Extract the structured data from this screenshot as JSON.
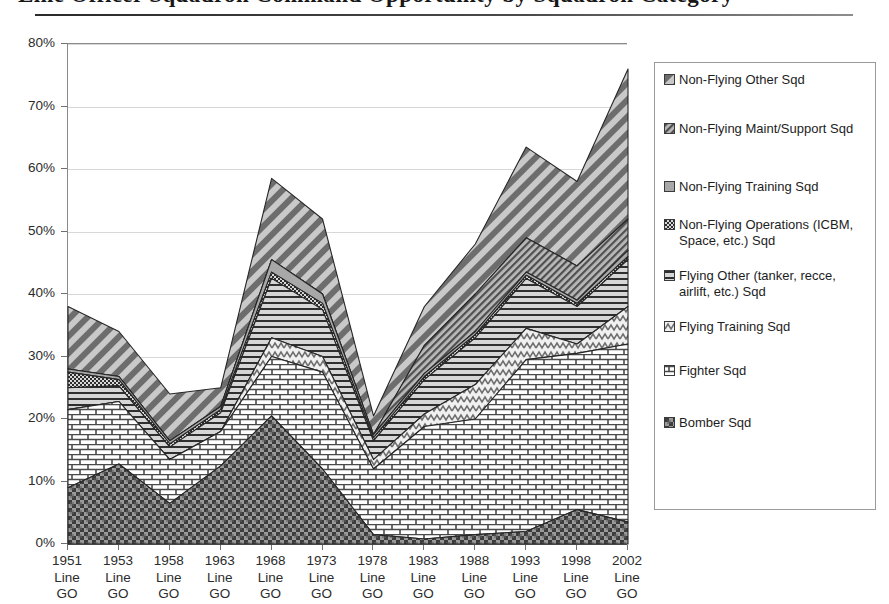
{
  "document": {
    "title_fragment": "Line Officer Squadron Command Opportunity by Squadron Category",
    "rule": "horizontal-rule"
  },
  "chart": {
    "y_axis": {
      "ticks": [
        "0%",
        "10%",
        "20%",
        "30%",
        "40%",
        "50%",
        "60%",
        "70%",
        "80%"
      ],
      "min": 0,
      "max": 80,
      "step": 10
    },
    "x_axis": {
      "line_label": "Line",
      "go_label": "GO"
    },
    "legend": {
      "items": [
        {
          "label": "Non-Flying Other Sqd",
          "pattern": "diagonal-stripe-dark"
        },
        {
          "label": "Non-Flying Maint/Support Sqd",
          "pattern": "diagonal-stripe-gray"
        },
        {
          "label": "Non-Flying Training Sqd",
          "pattern": "solid-gray"
        },
        {
          "label": "Non-Flying Operations (ICBM, Space, etc.) Sqd",
          "pattern": "checker-dot"
        },
        {
          "label": "Flying Other (tanker, recce, airlift, etc.) Sqd",
          "pattern": "horizontal-line"
        },
        {
          "label": "Flying Training Sqd",
          "pattern": "zigzag-light"
        },
        {
          "label": "Fighter Sqd",
          "pattern": "brick"
        },
        {
          "label": "Bomber Sqd",
          "pattern": "checker-dark"
        }
      ]
    }
  },
  "chart_data": {
    "type": "area",
    "stacked": true,
    "title": "Line Officer Squadron Command Opportunity by Squadron Category",
    "xlabel": "",
    "ylabel": "",
    "ylim": [
      0,
      80
    ],
    "grid": true,
    "legend_position": "right",
    "categories": [
      "1951 Line GO",
      "1953 Line GO",
      "1958 Line GO",
      "1963 Line GO",
      "1968 Line GO",
      "1973 Line GO",
      "1978 Line GO",
      "1983 Line GO",
      "1988 Line GO",
      "1993 Line GO",
      "1998 Line GO",
      "2002 Line GO"
    ],
    "category_years": [
      "1951",
      "1953",
      "1958",
      "1963",
      "1968",
      "1973",
      "1978",
      "1983",
      "1988",
      "1993",
      "1998",
      "2002"
    ],
    "series": [
      {
        "name": "Bomber Sqd",
        "values": [
          9.0,
          12.8,
          6.5,
          12.5,
          20.5,
          12.0,
          1.5,
          0.8,
          1.5,
          2.0,
          5.5,
          3.5
        ]
      },
      {
        "name": "Fighter Sqd",
        "values": [
          12.5,
          10.0,
          7.0,
          5.5,
          9.5,
          15.5,
          10.5,
          18.0,
          18.5,
          27.5,
          25.0,
          28.5
        ]
      },
      {
        "name": "Flying Training Sqd",
        "values": [
          0.0,
          0.0,
          0.0,
          0.0,
          3.0,
          2.5,
          1.5,
          2.0,
          5.5,
          5.0,
          1.5,
          6.0
        ]
      },
      {
        "name": "Flying Other (tanker, recce, airlift, etc.) Sqd",
        "values": [
          3.5,
          2.5,
          2.0,
          3.0,
          9.5,
          7.5,
          3.0,
          5.5,
          7.5,
          8.0,
          6.0,
          7.5
        ]
      },
      {
        "name": "Non-Flying Operations (ICBM, Space, etc.) Sqd",
        "values": [
          2.5,
          1.0,
          0.5,
          0.5,
          1.0,
          1.0,
          0.5,
          0.5,
          0.5,
          0.5,
          0.5,
          0.5
        ]
      },
      {
        "name": "Non-Flying Training Sqd",
        "values": [
          0.5,
          0.5,
          0.5,
          0.5,
          2.0,
          1.5,
          0.5,
          0.5,
          0.5,
          0.5,
          0.5,
          1.0
        ]
      },
      {
        "name": "Non-Flying Maint/Support Sqd",
        "values": [
          0.0,
          0.0,
          0.0,
          0.0,
          0.0,
          0.0,
          0.0,
          4.5,
          6.0,
          5.5,
          5.5,
          5.0
        ]
      },
      {
        "name": "Non-Flying Other Sqd",
        "values": [
          10.0,
          7.2,
          7.5,
          3.0,
          13.0,
          12.0,
          3.0,
          6.2,
          8.0,
          14.5,
          13.5,
          24.0
        ]
      }
    ],
    "stack_tops": [
      [
        9.0,
        21.5,
        21.5,
        25.0,
        27.5,
        28.0,
        28.0,
        38.0
      ],
      [
        12.8,
        22.8,
        22.8,
        25.3,
        26.3,
        26.8,
        26.8,
        34.0
      ],
      [
        6.5,
        13.5,
        13.5,
        15.5,
        16.0,
        16.5,
        16.5,
        24.0
      ],
      [
        12.5,
        18.0,
        18.0,
        21.0,
        21.5,
        22.0,
        22.0,
        25.0
      ],
      [
        20.5,
        30.0,
        33.0,
        42.5,
        43.5,
        45.5,
        45.5,
        58.5
      ],
      [
        12.0,
        27.5,
        30.0,
        37.5,
        38.5,
        40.0,
        40.0,
        52.0
      ],
      [
        1.5,
        12.0,
        13.5,
        16.5,
        17.0,
        17.5,
        17.5,
        20.5
      ],
      [
        0.8,
        18.8,
        20.8,
        26.3,
        26.8,
        27.3,
        31.8,
        38.0
      ],
      [
        1.5,
        20.0,
        25.5,
        33.0,
        33.5,
        34.0,
        40.0,
        48.0
      ],
      [
        2.0,
        29.5,
        34.5,
        42.5,
        43.0,
        43.5,
        49.0,
        63.5
      ],
      [
        5.5,
        30.5,
        32.0,
        38.0,
        38.5,
        39.0,
        44.5,
        58.0
      ],
      [
        3.5,
        32.0,
        38.0,
        45.5,
        46.0,
        47.0,
        52.0,
        76.0
      ]
    ]
  }
}
